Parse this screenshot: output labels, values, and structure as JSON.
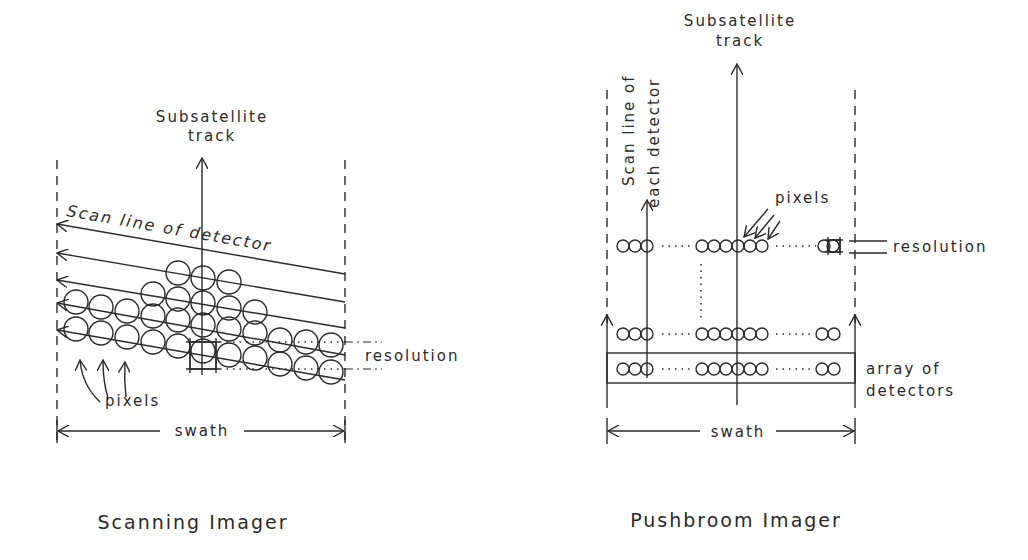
{
  "scanning": {
    "title": "Scanning Imager",
    "track_label_1": "Subsatellite",
    "track_label_2": "track",
    "scan_label": "Scan line of detector",
    "resolution_label": "resolution",
    "pixels_label": "pixels",
    "swath_label": "swath"
  },
  "pushbroom": {
    "title": "Pushbroom Imager",
    "track_label_1": "Subsatellite",
    "track_label_2": "track",
    "scan_label_1": "Scan line of",
    "scan_label_2": "each detector",
    "pixels_label": "pixels",
    "resolution_label": "resolution",
    "array_label_1": "array of",
    "array_label_2": "detectors",
    "swath_label": "swath"
  }
}
